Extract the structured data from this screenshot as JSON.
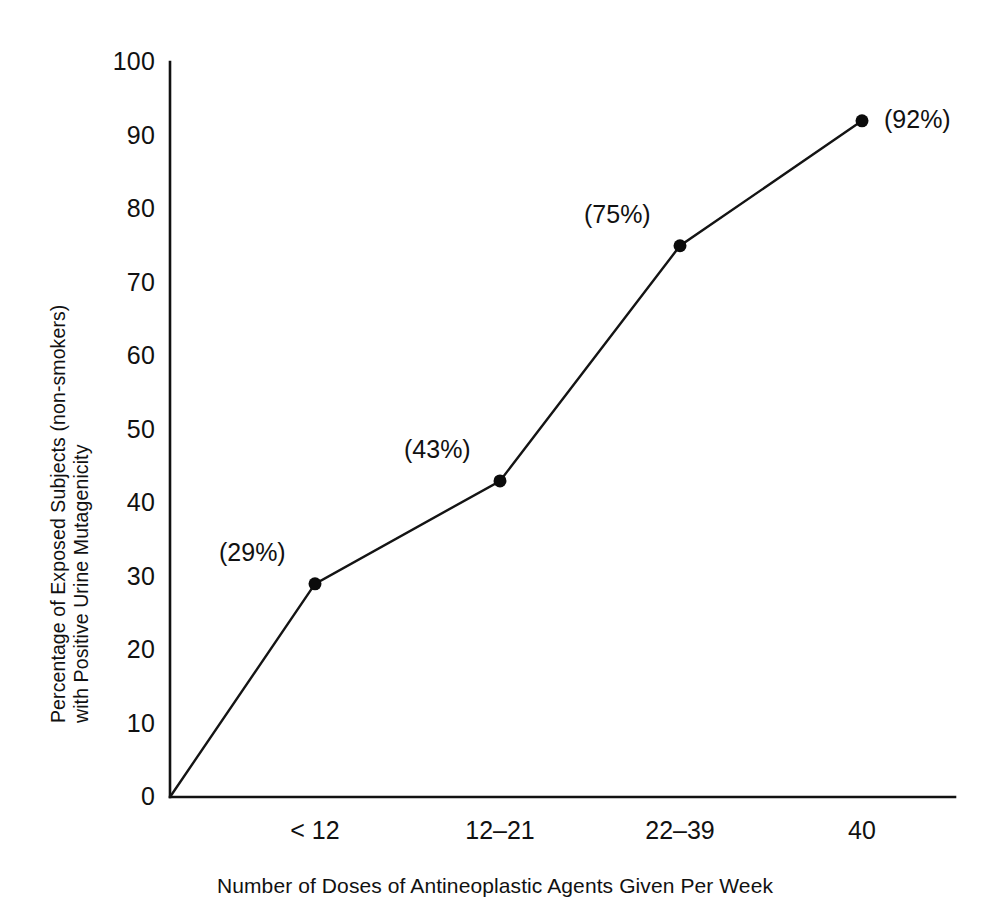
{
  "chart_data": {
    "type": "line",
    "title": "",
    "subtitle": "",
    "xlabel": "Number of Doses of Antineoplastic Agents Given Per Week",
    "ylabel_line1": "Percentage of Exposed Subjects (non-smokers)",
    "ylabel_line2": "with Positive Urine Mutagenicity",
    "categories": [
      "< 12",
      "12–21",
      "22–39",
      "40"
    ],
    "values": [
      29,
      43,
      75,
      92
    ],
    "point_labels": [
      "(29%)",
      "(43%)",
      "(75%)",
      "(92%)"
    ],
    "origin_point": {
      "x": 0,
      "y": 0,
      "drawn": true
    },
    "ylim": [
      0,
      100
    ],
    "yticks": [
      0,
      10,
      20,
      30,
      40,
      50,
      60,
      70,
      80,
      90,
      100
    ],
    "ytick_labels": [
      "0",
      "10",
      "20",
      "30",
      "40",
      "50",
      "60",
      "70",
      "80",
      "90",
      "100"
    ],
    "grid": false,
    "legend": null,
    "legend_position": "none",
    "marker": "filled-circle",
    "line_color": "#141414",
    "marker_color": "#0b0b0b",
    "axis_color": "#111111",
    "background_color": "#ffffff"
  },
  "annotations": {
    "label_placement": [
      "upper-left",
      "upper-left",
      "upper-left",
      "right"
    ]
  }
}
